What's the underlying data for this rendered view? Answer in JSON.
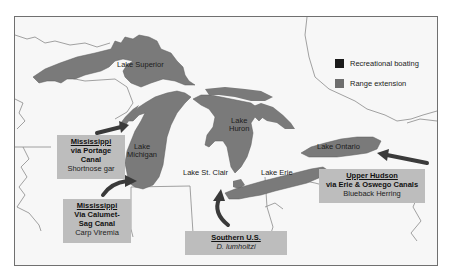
{
  "map": {
    "lakes": [
      {
        "name": "Lake Superior"
      },
      {
        "name": "Lake Michigan",
        "line1": "Lake",
        "line2": "Michigan"
      },
      {
        "name": "Lake Huron",
        "line1": "Lake",
        "line2": "Huron"
      },
      {
        "name": "Lake St. Clair"
      },
      {
        "name": "Lake Erie"
      },
      {
        "name": "Lake Ontario"
      }
    ],
    "colors": {
      "lake_fill": "#7a7a7a",
      "land": "#f7f7f7",
      "border": "#8a8a8a",
      "callout_bg": "#bdbdbd",
      "arrow": "#3a3a3a",
      "recreational_boating": "#1a1a1a",
      "range_extension": "#6e6e6e"
    }
  },
  "legend": {
    "items": [
      {
        "label": "Recreational boating",
        "color": "#1a1a1a"
      },
      {
        "label": "Range extension",
        "color": "#6e6e6e"
      }
    ]
  },
  "callouts": [
    {
      "source": "Mississippi",
      "via_line1": "via Portage",
      "via_line2": "Canal",
      "species": "Shortnose gar"
    },
    {
      "source": "Mississippi",
      "via_line1": "Via Calumet-",
      "via_line2": "Sag Canal",
      "species": "Carp Viremia"
    },
    {
      "source": "Southern U.S.",
      "species": "D. lumholtzi"
    },
    {
      "source": "Upper Hudson",
      "via_line1": "via Erie & Oswego Canals",
      "species": "Blueback Herring"
    }
  ]
}
